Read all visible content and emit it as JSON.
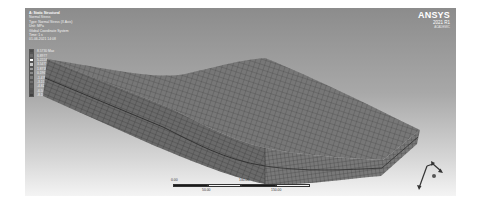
{
  "app": {
    "brand": "ANSYS",
    "version": "2021 R1",
    "edition_text": "ACADEMIC"
  },
  "result_info": {
    "lines": [
      "A: Static Structural",
      "Normal Stress",
      "Type: Normal Stress (X Axis)",
      "Unit: MPa",
      "Global Coordinate System",
      "Time: 1 s",
      "01-06-2021 14:08"
    ]
  },
  "legend": {
    "entries": [
      {
        "label": "8.5730 Max",
        "color": "#4a4a4a"
      },
      {
        "label": "6.8977",
        "color": "#6a6a6a"
      },
      {
        "label": "5.2224",
        "color": "#ffffff"
      },
      {
        "label": "3.5471",
        "color": "#c8c8c8"
      },
      {
        "label": "1.8718",
        "color": "#9a9a9a"
      },
      {
        "label": "0.19653",
        "color": "#8a8a8a"
      },
      {
        "label": "-1.4788",
        "color": "#7a7a7a"
      },
      {
        "label": "-3.1541",
        "color": "#6e6e6e"
      },
      {
        "label": "-4.8294",
        "color": "#5e5e5e"
      },
      {
        "label": "-6.5047",
        "color": "#505050"
      },
      {
        "label": "-8.1800 Min",
        "color": "#404040"
      }
    ]
  },
  "scale_bar": {
    "labels_top": [
      "0.00",
      "100.00"
    ],
    "labels_bottom": [
      "50.00",
      "150.00"
    ],
    "unit": "mm"
  },
  "triad": {
    "axes": [
      "X",
      "Y",
      "Z"
    ]
  },
  "colors": {
    "viewport_top": "#8c8c8c",
    "viewport_bottom": "#f4f4f4",
    "mesh_fill": "#6c6c6c",
    "mesh_line": "#3a3a3a"
  }
}
